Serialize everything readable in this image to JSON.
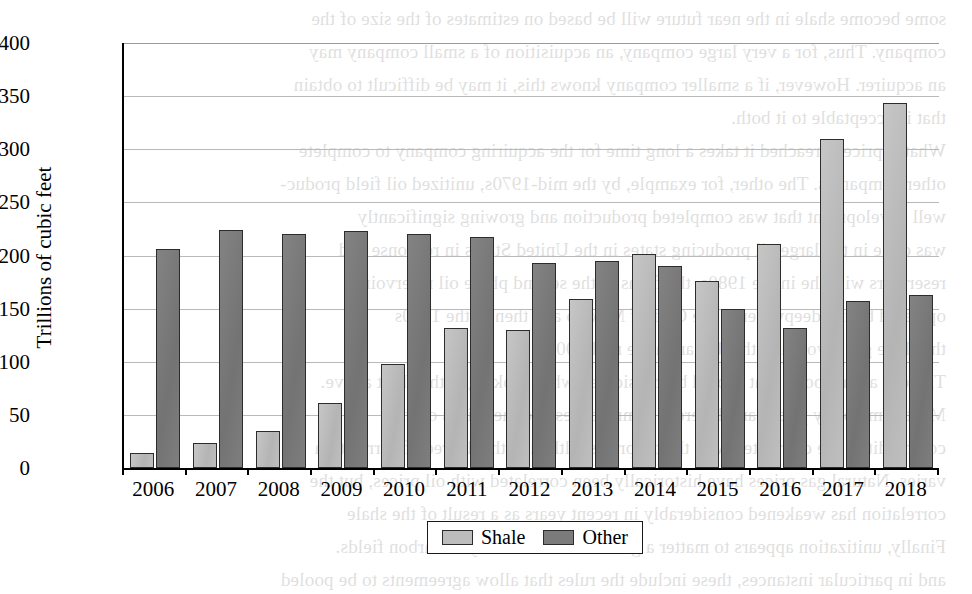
{
  "chart_data": {
    "type": "bar",
    "title": "",
    "subtitle": "",
    "xlabel": "",
    "ylabel": "Trillions of cubic feet",
    "categories": [
      "2006",
      "2007",
      "2008",
      "2009",
      "2010",
      "2011",
      "2012",
      "2013",
      "2014",
      "2015",
      "2016",
      "2017",
      "2018"
    ],
    "series": [
      {
        "name": "Shale",
        "color": "#bdbdbd",
        "values": [
          14,
          24,
          35,
          61,
          98,
          132,
          130,
          159,
          201,
          176,
          211,
          310,
          344
        ]
      },
      {
        "name": "Other",
        "color": "#7b7b7b",
        "values": [
          206,
          224,
          220,
          223,
          220,
          217,
          193,
          195,
          190,
          150,
          132,
          157,
          163
        ]
      }
    ],
    "ylim": [
      0,
      400
    ],
    "ytick_step": 50,
    "yticks": [
      "400",
      "350",
      "300",
      "250",
      "200",
      "150",
      "100",
      "50",
      "0"
    ],
    "grid": true,
    "legend_position": "bottom-center"
  },
  "legend": {
    "entries": [
      {
        "label": "Shale",
        "swatch": "light-gray-swatch"
      },
      {
        "label": "Other",
        "swatch": "dark-gray-swatch"
      }
    ]
  },
  "background_text": {
    "note": "faint mirrored bleed-through text from reverse page",
    "lines": [
      "some become shale in the near future will be based on estimates of the size of the",
      "company. Thus, for a very large company, an acquisition of a small company may",
      "an acquirer. However, if a smaller company knows this, it may be difficult to obtain",
      "that is acceptable to it both.",
      "What if price is reached it takes a long time for the acquiring company to complete",
      "other companies. The other, for example, by the mid-1970s, unitized oil field produc-",
      "well development that was completed production and growing significantly",
      "was done in the large oil producing states in the United States in response and",
      "reservoirs with the in the 1980s, the firms in the second phase oil reservoirs",
      "operated by the deepwater in the Gulf of Mexico and then in the 1990s",
      "the shale gas revolution that began in the mid-2000s.",
      "There is a final point that should be considered when looking at the chart above.",
      "Most commodity prices are different commodities and the prices of the",
      "commodities are correlated with the oil prices, although the degree of correlation",
      "varies. Natural gas prices have historically been correlated with oil prices, but the",
      "correlation has weakened considerably in recent years as a result of the shale",
      "Finally, unitization appears to matter a great deal for shale hydrocarbon fields.",
      "and in particular instances, these include the rules that allow agreements to be pooled"
    ]
  }
}
